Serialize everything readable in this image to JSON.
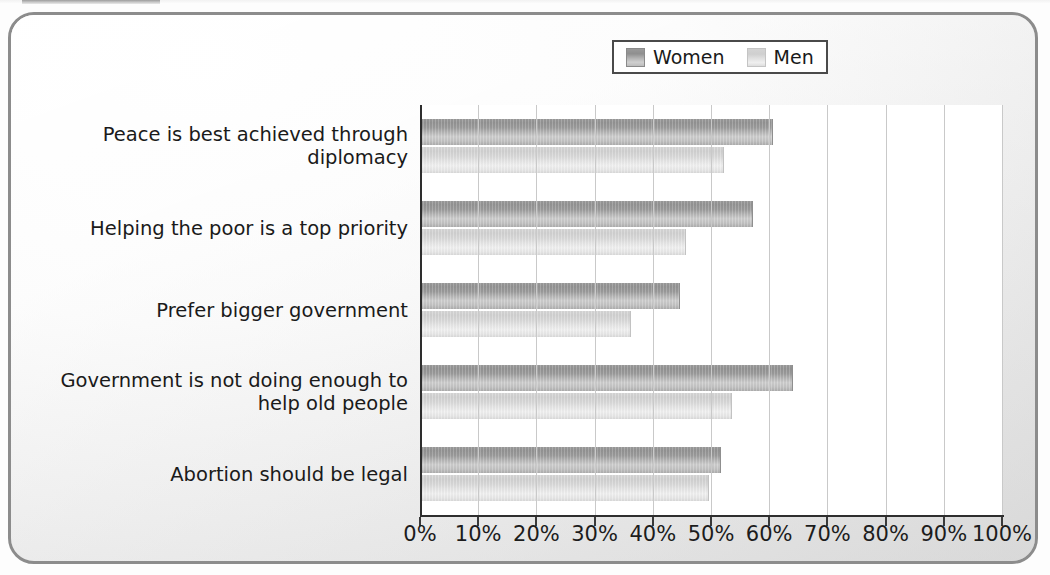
{
  "chart_data": {
    "type": "bar",
    "orientation": "horizontal",
    "title": "",
    "subtitle": "",
    "xlabel": "",
    "ylabel": "",
    "xlim": [
      0,
      100
    ],
    "xtick_labels": [
      "0%",
      "10%",
      "20%",
      "30%",
      "40%",
      "50%",
      "60%",
      "70%",
      "80%",
      "90%",
      "100%"
    ],
    "xtick_values": [
      0,
      10,
      20,
      30,
      40,
      50,
      60,
      70,
      80,
      90,
      100
    ],
    "grid": true,
    "grid_axis": "x",
    "legend_position": "top-right",
    "categories": [
      "Peace is best achieved through diplomacy",
      "Helping the poor is a top priority",
      "Prefer bigger government",
      "Government is not doing enough to\nhelp old people",
      "Abortion should be legal"
    ],
    "series": [
      {
        "name": "Women",
        "color": "#9c9c9c",
        "values": [
          60.5,
          57,
          44.5,
          64,
          51.5
        ]
      },
      {
        "name": "Men",
        "color": "#d8d8d8",
        "values": [
          52,
          45.5,
          36,
          53.5,
          49.5
        ]
      }
    ]
  },
  "legend": {
    "entries": [
      {
        "label": "Women",
        "swatch": "women-swatch"
      },
      {
        "label": "Men",
        "swatch": "men-swatch"
      }
    ]
  },
  "colors": {
    "frame_border": "#8c8c8c",
    "axis": "#2e2e2e",
    "gridline": "#c9c9c9",
    "plot_background": "#ffffff",
    "women_bar": "#9c9c9c",
    "men_bar": "#d8d8d8",
    "text": "#1a1a1a"
  }
}
